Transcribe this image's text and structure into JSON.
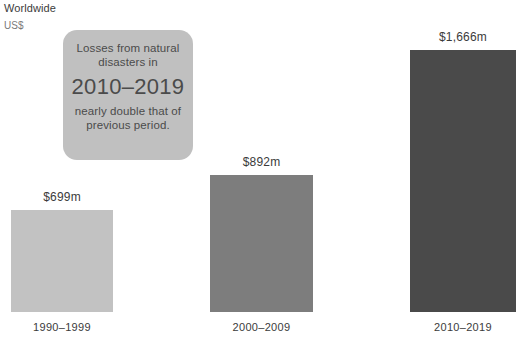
{
  "header": {
    "scope_label": "Worldwide",
    "currency_label": "US$"
  },
  "callout": {
    "line1": "Losses from natural",
    "line2": "disasters in",
    "emphasis": "2010–2019",
    "line3": "nearly double that of",
    "line4": "previous period."
  },
  "chart_data": {
    "type": "bar",
    "title": "",
    "subtitle": "",
    "xlabel": "",
    "ylabel": "US$",
    "scope": "Worldwide",
    "grid": false,
    "legend": "none",
    "ylim": [
      0,
      1666
    ],
    "categories": [
      "1990–1999",
      "2000–2009",
      "2010–2019"
    ],
    "values": [
      699,
      892,
      1666
    ],
    "value_labels": [
      "$699m",
      "$892m",
      "$1,666m"
    ],
    "units": "millions of US dollars",
    "bars": [
      {
        "category": "1990–1999",
        "value": 699,
        "value_label": "$699m",
        "color": "#c2c2c2",
        "left_px": 11,
        "width_px": 102,
        "height_px": 102
      },
      {
        "category": "2000–2009",
        "value": 892,
        "value_label": "$892m",
        "color": "#7d7d7d",
        "left_px": 210,
        "width_px": 103,
        "height_px": 137
      },
      {
        "category": "2010–2019",
        "value": 1666,
        "value_label": "$1,666m",
        "color": "#4a4a4a",
        "left_px": 410,
        "width_px": 106,
        "height_px": 262
      }
    ],
    "annotations": [
      {
        "text": "Losses from natural disasters in 2010–2019 nearly double that of previous period.",
        "attached_to": "2010–2019"
      }
    ]
  },
  "colors": {
    "background": "#ffffff",
    "text": "#3b3b3b",
    "callout_background": "#c0c0c0",
    "callout_text": "#4b4b4b",
    "bar_1": "#c2c2c2",
    "bar_2": "#7d7d7d",
    "bar_3": "#4a4a4a"
  }
}
